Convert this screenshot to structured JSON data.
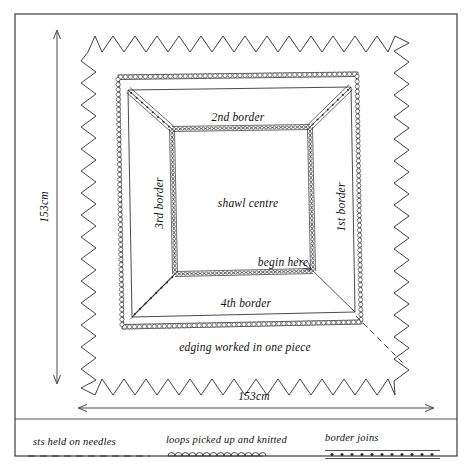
{
  "diagram": {
    "labels": {
      "shawl_centre": "shawl centre",
      "border_1": "1st border",
      "border_2": "2nd border",
      "border_3": "3rd border",
      "border_4": "4th border",
      "begin_here": "begin here",
      "edging": "edging worked in one piece"
    },
    "dimensions": {
      "height": "153cm",
      "width": "153cm"
    }
  },
  "legend": {
    "items": [
      {
        "label": "sts held on needles",
        "key": "dashed-line"
      },
      {
        "label": "loops picked up and knitted",
        "key": "scalloped-line"
      },
      {
        "label": "border joins",
        "key": "dotted-double-line"
      }
    ]
  },
  "colors": {
    "ink": "#1a1a1a",
    "line": "#2b2b2b",
    "paper": "#ffffff"
  },
  "chart_data": {
    "type": "diagram",
    "regions": [
      {
        "name": "shawl centre",
        "position": "center"
      },
      {
        "name": "1st border",
        "position": "right"
      },
      {
        "name": "2nd border",
        "position": "top"
      },
      {
        "name": "3rd border",
        "position": "left"
      },
      {
        "name": "4th border",
        "position": "bottom"
      },
      {
        "name": "edging worked in one piece",
        "position": "outer-zigzag"
      }
    ],
    "annotations": [
      {
        "text": "begin here",
        "target": "bottom-right corner of shawl centre"
      },
      {
        "text": "153cm",
        "axis": "height"
      },
      {
        "text": "153cm",
        "axis": "width"
      }
    ],
    "legend_keys": [
      "sts held on needles",
      "loops picked up and knitted",
      "border joins"
    ]
  }
}
